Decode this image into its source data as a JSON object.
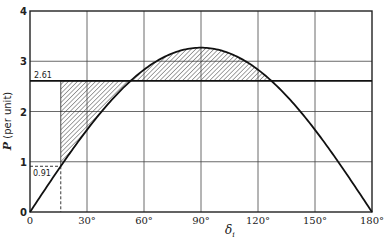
{
  "chart_data": {
    "type": "line",
    "title": "",
    "xlabel": "δi",
    "xlabel_main": "δ",
    "xlabel_sub": "i",
    "ylabel": "P (per unit)",
    "ylabel_symbol": "P",
    "ylabel_unit": " (per unit)",
    "xlim": [
      0,
      180
    ],
    "ylim": [
      0,
      4
    ],
    "grid": true,
    "x_ticks": [
      0,
      30,
      60,
      90,
      120,
      150,
      180
    ],
    "x_tick_labels": [
      "0",
      "30°",
      "60°",
      "90°",
      "120°",
      "150°",
      "180°"
    ],
    "y_ticks": [
      0,
      1,
      2,
      3,
      4
    ],
    "y_tick_labels": [
      "0",
      "1",
      "2",
      "3",
      "4"
    ],
    "series": [
      {
        "name": "Power-angle curve",
        "formula": "P = Pmax sin(δ)",
        "Pmax": 3.27,
        "x": [
          0,
          15,
          30,
          45,
          60,
          75,
          90,
          105,
          120,
          135,
          150,
          165,
          180
        ],
        "values": [
          0,
          0.85,
          1.64,
          2.31,
          2.83,
          3.16,
          3.27,
          3.16,
          2.83,
          2.31,
          1.64,
          0.85,
          0
        ]
      },
      {
        "name": "Mechanical input power",
        "type": "horizontal_line",
        "value": 2.61
      }
    ],
    "annotations": [
      {
        "text": "2.61",
        "type": "hline_label",
        "y": 2.61
      },
      {
        "text": "0.91",
        "type": "dashed_reference",
        "y": 0.91,
        "x_deg": 16.2
      }
    ],
    "shaded_regions": [
      {
        "name": "accelerating-area",
        "from_deg": 16.2,
        "to_deg": 52.96,
        "between": "P=2.61 line and curve (curve below)",
        "pattern": "hatched"
      },
      {
        "name": "decelerating-area",
        "from_deg": 52.96,
        "to_deg": 127.04,
        "between": "curve and P=2.61 line (curve above)",
        "pattern": "hatched"
      }
    ]
  }
}
